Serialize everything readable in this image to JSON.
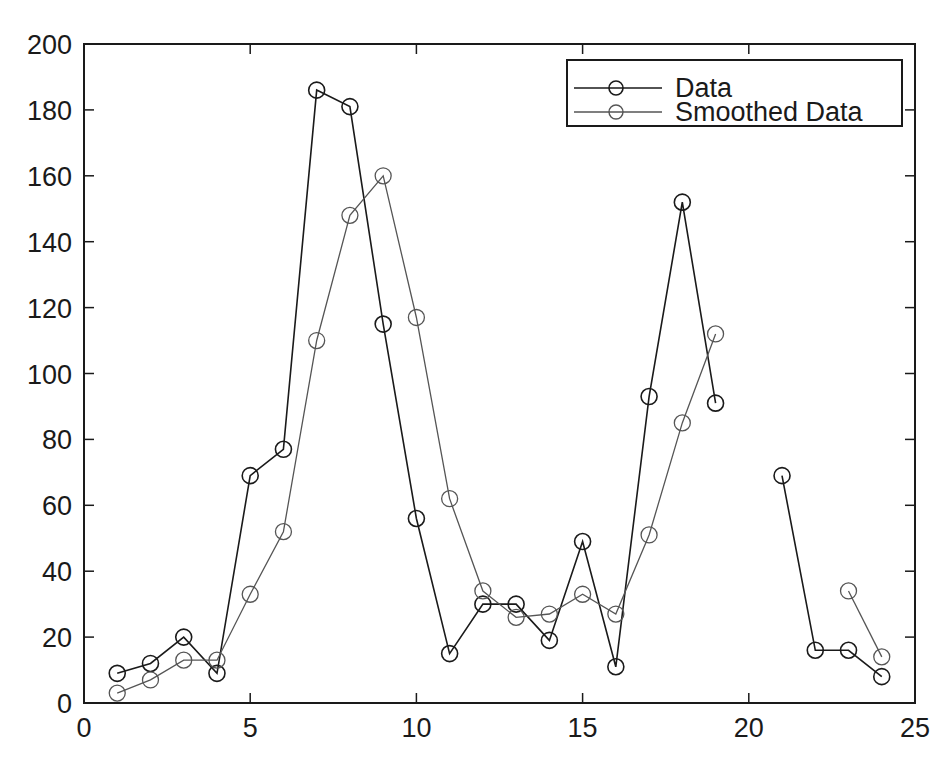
{
  "chart_data": {
    "type": "line",
    "title": "",
    "xlabel": "",
    "ylabel": "",
    "xlim": [
      0,
      25
    ],
    "ylim": [
      0,
      200
    ],
    "grid": false,
    "legend_position": "upper right",
    "x_ticks": [
      0,
      5,
      10,
      15,
      20,
      25
    ],
    "y_ticks": [
      0,
      20,
      40,
      60,
      80,
      100,
      120,
      140,
      160,
      180,
      200
    ],
    "x": [
      1,
      2,
      3,
      4,
      5,
      6,
      7,
      8,
      9,
      10,
      11,
      12,
      13,
      14,
      15,
      16,
      17,
      18,
      19,
      20,
      21,
      22,
      23,
      24
    ],
    "series": [
      {
        "name": "Data",
        "color": "#1a1a1a",
        "marker": "circle",
        "values": [
          9,
          12,
          20,
          9,
          69,
          77,
          186,
          181,
          115,
          56,
          15,
          30,
          30,
          19,
          49,
          11,
          93,
          152,
          91,
          null,
          69,
          16,
          16,
          8
        ]
      },
      {
        "name": "Smoothed Data",
        "color": "#555555",
        "marker": "circle",
        "values": [
          3,
          7,
          13,
          13,
          33,
          52,
          110,
          148,
          160,
          117,
          62,
          34,
          26,
          27,
          33,
          27,
          51,
          85,
          112,
          null,
          null,
          null,
          34,
          14
        ]
      }
    ]
  },
  "legend": {
    "items": [
      {
        "label": "Data"
      },
      {
        "label": "Smoothed Data"
      }
    ]
  }
}
